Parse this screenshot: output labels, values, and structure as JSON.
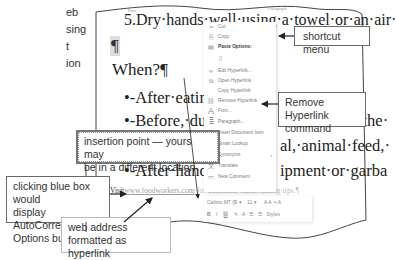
{
  "side_caption": [
    "eb",
    "sing",
    "t",
    "ion"
  ],
  "ribbon": {
    "font_label": "Font",
    "paragraph_label": "Paragraph"
  },
  "document": {
    "line1": "5.Dry·hands·well·using·a·towel·or·an·air·",
    "para_mark": "¶",
    "heading": "When?¶",
    "bullets": [
      "•-After·eatin",
      "•-Before,·du",
      "•-After·",
      "•-After·hand"
    ],
    "right_fragments": [
      "someone·in·the·",
      "al,·animal·feed,·",
      "ipment·or·garba"
    ],
    "visit_prefix": "Visit",
    "url": "www.foodworkers.com",
    "visit_suffix": "·for·additional·handwashing·tips.¶"
  },
  "context_menu": {
    "items": [
      {
        "icon": "scissors-icon",
        "glyph": "✂",
        "label": "Cut"
      },
      {
        "icon": "copy-icon",
        "glyph": "⎘",
        "label": "Copy"
      },
      {
        "icon": "paste-icon",
        "glyph": "📋",
        "label": "Paste Options:",
        "bold": true
      },
      {
        "icon": "clipboard-icon",
        "glyph": "▯",
        "label": ""
      },
      {
        "icon": "edit-link-icon",
        "glyph": "∞",
        "label": "Edit Hyperlink..."
      },
      {
        "icon": "open-link-icon",
        "glyph": "⧉",
        "label": "Open Hyperlink"
      },
      {
        "icon": "",
        "glyph": "",
        "label": "Copy Hyperlink"
      },
      {
        "icon": "remove-link-icon",
        "glyph": "⛓",
        "label": "Remove Hyperlink"
      },
      {
        "icon": "font-icon",
        "glyph": "A",
        "label": "Font..."
      },
      {
        "icon": "paragraph-icon",
        "glyph": "≣",
        "label": "Paragraph..."
      },
      {
        "icon": "insert-item-icon",
        "glyph": "⊞",
        "label": "Insert Document Item"
      },
      {
        "icon": "smart-lookup-icon",
        "glyph": "⌕",
        "label": "Smart Lookup"
      },
      {
        "icon": "",
        "glyph": "",
        "label": "Synonyms",
        "submenu": true
      },
      {
        "icon": "translate-icon",
        "glyph": "文",
        "label": "Translate"
      },
      {
        "icon": "comment-icon",
        "glyph": "▭",
        "label": "New Comment"
      }
    ]
  },
  "mini_toolbar": {
    "font": "Calisto MT (B",
    "size": "11",
    "row1_extra": "A  A  ✑  A",
    "bold": "B",
    "italic": "I",
    "underline": "U",
    "row2_extra": "✎ · A · ☰ · ☰ ·  Styles"
  },
  "callouts": {
    "shortcut_menu": "shortcut menu",
    "remove_hyperlink": [
      "Remove Hyperlink",
      "command"
    ],
    "insertion_point": [
      "insertion point — yours may",
      "be in a different location"
    ],
    "autocorrect": [
      "clicking blue box would",
      "display AutoCorrect",
      "Options button"
    ],
    "web_address": [
      "web address",
      "formatted as hyperlink"
    ]
  }
}
